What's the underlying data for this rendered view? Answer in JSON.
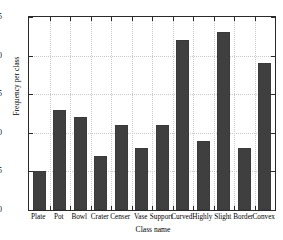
{
  "chart_data": {
    "type": "bar",
    "title": "",
    "xlabel": "Class name",
    "ylabel": "Frequency per class",
    "categories": [
      "Plate",
      "Pot",
      "Bowl",
      "Crater",
      "Censer",
      "Vase",
      "Support",
      "Curved",
      "Highly",
      "Slight",
      "Border",
      "Convex"
    ],
    "values": [
      5,
      13,
      12,
      7,
      11,
      8,
      11,
      22,
      9,
      23,
      8,
      19
    ],
    "ylim": [
      0,
      25
    ],
    "yticks": [
      0,
      5,
      10,
      15,
      20,
      25
    ],
    "ytick_labels": [
      "0",
      "5",
      "10",
      "15",
      "20",
      "25"
    ],
    "grid": true,
    "legend": null,
    "bar_color": "#3f3f3f",
    "axis_color": "#2a2a2a",
    "grid_color": "#c9c9c9",
    "background": "#ffffff"
  }
}
